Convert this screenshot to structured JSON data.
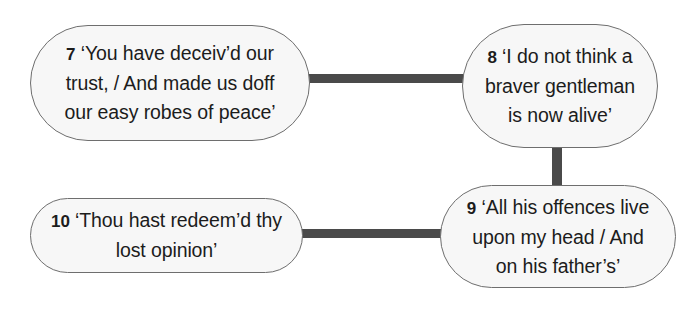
{
  "diagram": {
    "type": "node-link-diagram",
    "title": "",
    "style": {
      "node_fill": "#f7f7f7",
      "node_border": "#6e6e6e",
      "connector_color": "#4a4a4a",
      "text_color": "#1c1c1c",
      "background": "#ffffff"
    },
    "nodes": [
      {
        "id": "7",
        "number": "7",
        "quote": "‘You have deceiv’d our trust, / And made us doff our easy robes of peace’",
        "text": "7 ‘You have deceiv’d our\ntrust, / And made us doff\nour easy robes of peace’",
        "lines": [
          "7 ‘You have deceiv’d our",
          "trust, / And made us doff",
          "our easy robes of peace’"
        ]
      },
      {
        "id": "8",
        "number": "8",
        "quote": "‘I do not think a braver gentleman is now alive’",
        "text": "8 ‘I do not think a\nbraver gentleman\nis now alive’",
        "lines": [
          "8 ‘I do not think a",
          "braver gentleman",
          "is now alive’"
        ]
      },
      {
        "id": "9",
        "number": "9",
        "quote": "‘All his offences live upon my head / And on his father’s’",
        "text": "9 ‘All his offences live\nupon my head / And\non his father’s’",
        "lines": [
          "9 ‘All his offences live",
          "upon my head / And",
          "on his father’s’"
        ]
      },
      {
        "id": "10",
        "number": "10",
        "quote": "‘Thou hast redeem’d thy lost opinion’",
        "text": "10 ‘Thou hast redeem’d thy\nlost opinion’",
        "lines": [
          "10 ‘Thou hast redeem’d thy",
          "lost opinion’"
        ]
      }
    ],
    "edges": [
      {
        "id": "7-8",
        "from": "7",
        "to": "8",
        "orientation": "horizontal"
      },
      {
        "id": "8-9",
        "from": "8",
        "to": "9",
        "orientation": "vertical"
      },
      {
        "id": "10-9",
        "from": "10",
        "to": "9",
        "orientation": "horizontal"
      }
    ]
  }
}
